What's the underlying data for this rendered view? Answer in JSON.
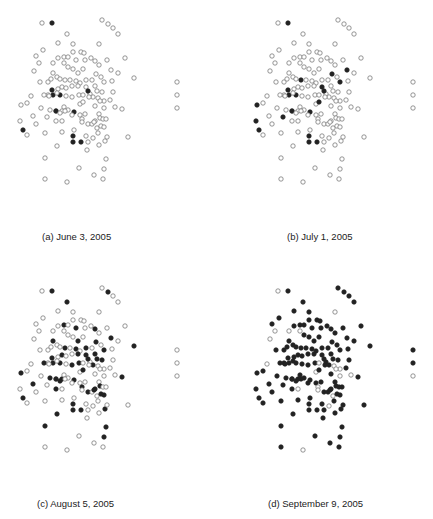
{
  "figure": {
    "node_style": {
      "radius": 2.2,
      "empty_stroke": "#7a7a7a",
      "empty_fill": "#ffffff",
      "filled_color": "#222222"
    },
    "layout": [
      [
        42,
        23
      ],
      [
        52,
        23
      ],
      [
        102,
        20
      ],
      [
        108,
        24
      ],
      [
        113,
        28
      ],
      [
        118,
        34
      ],
      [
        67,
        34
      ],
      [
        99,
        44
      ],
      [
        58,
        43
      ],
      [
        73,
        44
      ],
      [
        43,
        50
      ],
      [
        36,
        56
      ],
      [
        73,
        52
      ],
      [
        81,
        52
      ],
      [
        84,
        53
      ],
      [
        125,
        58
      ],
      [
        39,
        63
      ],
      [
        53,
        63
      ],
      [
        58,
        58
      ],
      [
        64,
        57
      ],
      [
        68,
        57
      ],
      [
        76,
        60
      ],
      [
        85,
        60
      ],
      [
        91,
        58
      ],
      [
        95,
        61
      ],
      [
        99,
        65
      ],
      [
        107,
        60
      ],
      [
        34,
        71
      ],
      [
        64,
        63
      ],
      [
        83,
        69
      ],
      [
        73,
        69
      ],
      [
        53,
        73
      ],
      [
        68,
        67
      ],
      [
        78,
        73
      ],
      [
        111,
        70
      ],
      [
        118,
        73
      ],
      [
        40,
        82
      ],
      [
        48,
        82
      ],
      [
        51,
        79
      ],
      [
        57,
        77
      ],
      [
        60,
        79
      ],
      [
        65,
        80
      ],
      [
        70,
        80
      ],
      [
        76,
        81
      ],
      [
        80,
        83
      ],
      [
        86,
        80
      ],
      [
        92,
        80
      ],
      [
        96,
        74
      ],
      [
        101,
        77
      ],
      [
        104,
        82
      ],
      [
        112,
        81
      ],
      [
        134,
        78
      ],
      [
        58,
        89
      ],
      [
        62,
        87
      ],
      [
        66,
        88
      ],
      [
        72,
        86
      ],
      [
        78,
        86
      ],
      [
        86,
        87
      ],
      [
        90,
        94
      ],
      [
        95,
        86
      ],
      [
        97,
        91
      ],
      [
        102,
        92
      ],
      [
        48,
        95
      ],
      [
        53,
        95
      ],
      [
        60,
        95
      ],
      [
        66,
        96
      ],
      [
        72,
        97
      ],
      [
        79,
        95
      ],
      [
        83,
        95
      ],
      [
        88,
        91
      ],
      [
        93,
        97
      ],
      [
        98,
        98
      ],
      [
        104,
        101
      ],
      [
        110,
        100
      ],
      [
        113,
        92
      ],
      [
        31,
        96
      ],
      [
        44,
        95
      ],
      [
        49,
        96
      ],
      [
        52,
        90
      ],
      [
        57,
        93
      ],
      [
        21,
        105
      ],
      [
        27,
        103
      ],
      [
        41,
        108
      ],
      [
        50,
        110
      ],
      [
        56,
        111
      ],
      [
        62,
        111
      ],
      [
        64,
        107
      ],
      [
        68,
        110
      ],
      [
        74,
        112
      ],
      [
        80,
        104
      ],
      [
        83,
        102
      ],
      [
        89,
        97
      ],
      [
        95,
        106
      ],
      [
        100,
        101
      ],
      [
        104,
        108
      ],
      [
        115,
        107
      ],
      [
        122,
        109
      ],
      [
        33,
        116
      ],
      [
        47,
        117
      ],
      [
        56,
        111
      ],
      [
        60,
        113
      ],
      [
        65,
        111
      ],
      [
        72,
        115
      ],
      [
        80,
        115
      ],
      [
        82,
        119
      ],
      [
        85,
        114
      ],
      [
        95,
        121
      ],
      [
        99,
        114
      ],
      [
        100,
        118
      ],
      [
        103,
        119
      ],
      [
        106,
        119
      ],
      [
        20,
        121
      ],
      [
        36,
        124
      ],
      [
        56,
        121
      ],
      [
        62,
        121
      ],
      [
        82,
        122
      ],
      [
        88,
        124
      ],
      [
        92,
        124
      ],
      [
        94,
        122
      ],
      [
        97,
        128
      ],
      [
        101,
        126
      ],
      [
        104,
        127
      ],
      [
        23,
        130
      ],
      [
        45,
        133
      ],
      [
        62,
        132
      ],
      [
        74,
        130
      ],
      [
        73,
        136
      ],
      [
        73,
        142
      ],
      [
        81,
        142
      ],
      [
        86,
        136
      ],
      [
        88,
        142
      ],
      [
        93,
        138
      ],
      [
        98,
        133
      ],
      [
        99,
        145
      ],
      [
        105,
        141
      ],
      [
        107,
        137
      ],
      [
        128,
        137
      ],
      [
        57,
        146
      ],
      [
        87,
        150
      ],
      [
        27,
        135
      ],
      [
        45,
        158
      ],
      [
        106,
        159
      ],
      [
        79,
        168
      ],
      [
        104,
        169
      ],
      [
        94,
        175
      ],
      [
        45,
        179
      ],
      [
        67,
        182
      ],
      [
        103,
        179
      ],
      [
        177,
        82
      ],
      [
        177,
        95
      ],
      [
        177,
        108
      ]
    ],
    "panels": [
      {
        "id": "a",
        "caption": "(a) June 3, 2005",
        "offset": [
          0,
          0
        ],
        "caption_pos": [
          42,
          237
        ],
        "filled": [
          1,
          64,
          69,
          78,
          88,
          63,
          99,
          126,
          128,
          127,
          154,
          122
        ]
      },
      {
        "id": "b",
        "caption": "(b) July 1, 2005",
        "offset": [
          236,
          0
        ],
        "caption_pos": [
          287,
          237
        ],
        "filled": [
          1,
          64,
          69,
          78,
          88,
          63,
          99,
          126,
          128,
          127,
          154,
          122,
          34,
          47,
          49,
          80,
          90,
          111,
          41,
          57,
          98,
          80
        ]
      },
      {
        "id": "c",
        "caption": "(c) August 5, 2005",
        "offset": [
          0,
          268
        ],
        "caption_pos": [
          37,
          504
        ],
        "filled": [
          1,
          64,
          69,
          78,
          88,
          63,
          99,
          126,
          128,
          127,
          154,
          122,
          3,
          6,
          21,
          24,
          31,
          33,
          34,
          41,
          43,
          45,
          47,
          49,
          51,
          56,
          57,
          59,
          61,
          66,
          67,
          70,
          76,
          80,
          83,
          85,
          90,
          96,
          97,
          100,
          104,
          108,
          113,
          116,
          118,
          120,
          121,
          134,
          137,
          141,
          140,
          143,
          19,
          53,
          106,
          60
        ]
      },
      {
        "id": "d",
        "caption": "(d) September 9, 2005",
        "offset": [
          236,
          268
        ],
        "caption_pos": [
          268,
          504
        ],
        "filled_all_except": [
          0,
          7,
          16,
          17,
          27,
          28,
          68,
          71,
          72,
          75,
          89,
          93,
          94,
          95,
          104,
          114,
          115,
          119,
          131,
          146,
          150,
          153,
          160,
          162
        ]
      }
    ]
  }
}
